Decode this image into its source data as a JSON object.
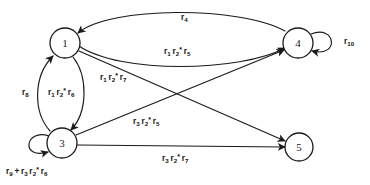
{
  "diagram": {
    "type": "state-transition-diagram",
    "background_color": "#ffffff",
    "stroke_color": "#1a1a1a",
    "nodes": [
      {
        "id": "1",
        "label": "1",
        "cx": 65,
        "cy": 43,
        "r": 15
      },
      {
        "id": "3",
        "label": "3",
        "cx": 62,
        "cy": 143,
        "r": 15
      },
      {
        "id": "4",
        "label": "4",
        "cx": 298,
        "cy": 43,
        "r": 15
      },
      {
        "id": "5",
        "label": "5",
        "cx": 299,
        "cy": 147,
        "r": 14
      }
    ],
    "edges": [
      {
        "id": "e-4-1",
        "from": "4",
        "to": "1",
        "shape": "arc-top",
        "label_plain": "r4",
        "label_parts": [
          {
            "base": "r",
            "sub": "4",
            "star": false
          }
        ],
        "label_x": 181,
        "label_y": 14
      },
      {
        "id": "e-1-4",
        "from": "1",
        "to": "4",
        "shape": "arc-bottom",
        "label_plain": "r1 r2* r5",
        "label_parts": [
          {
            "base": "r",
            "sub": "1",
            "star": false
          },
          {
            "base": "r",
            "sub": "2",
            "star": true
          },
          {
            "base": "r",
            "sub": "5",
            "star": false
          }
        ],
        "label_x": 164,
        "label_y": 48
      },
      {
        "id": "e-1-3",
        "from": "1",
        "to": "3",
        "shape": "lens-right",
        "label_plain": "r1 r2* r6",
        "label_parts": [
          {
            "base": "r",
            "sub": "1",
            "star": false
          },
          {
            "base": "r",
            "sub": "2",
            "star": true
          },
          {
            "base": "r",
            "sub": "6",
            "star": false
          }
        ],
        "label_x": 48,
        "label_y": 89
      },
      {
        "id": "e-3-1",
        "from": "3",
        "to": "1",
        "shape": "lens-left",
        "label_plain": "r8",
        "label_parts": [
          {
            "base": "r",
            "sub": "8",
            "star": false
          }
        ],
        "label_x": 22,
        "label_y": 89
      },
      {
        "id": "e-1-5",
        "from": "1",
        "to": "5",
        "shape": "diagonal",
        "label_plain": "r1 r2* r7",
        "label_parts": [
          {
            "base": "r",
            "sub": "1",
            "star": false
          },
          {
            "base": "r",
            "sub": "2",
            "star": true
          },
          {
            "base": "r",
            "sub": "7",
            "star": false
          }
        ],
        "label_x": 100,
        "label_y": 74
      },
      {
        "id": "e-3-4",
        "from": "3",
        "to": "4",
        "shape": "diagonal",
        "label_plain": "r3 r2* r5",
        "label_parts": [
          {
            "base": "r",
            "sub": "3",
            "star": false
          },
          {
            "base": "r",
            "sub": "2",
            "star": true
          },
          {
            "base": "r",
            "sub": "5",
            "star": false
          }
        ],
        "label_x": 133,
        "label_y": 118
      },
      {
        "id": "e-3-5",
        "from": "3",
        "to": "5",
        "shape": "straight",
        "label_plain": "r3 r2* r7",
        "label_parts": [
          {
            "base": "r",
            "sub": "3",
            "star": false
          },
          {
            "base": "r",
            "sub": "2",
            "star": true
          },
          {
            "base": "r",
            "sub": "7",
            "star": false
          }
        ],
        "label_x": 162,
        "label_y": 155
      },
      {
        "id": "e-4-4",
        "from": "4",
        "to": "4",
        "shape": "self-loop-right",
        "label_plain": "r10",
        "label_parts": [
          {
            "base": "r",
            "sub": "10",
            "star": false
          }
        ],
        "label_x": 344,
        "label_y": 38
      },
      {
        "id": "e-3-3",
        "from": "3",
        "to": "3",
        "shape": "self-loop-left",
        "label_plain": "r9 + r3 r2* r6",
        "label_parts": [
          {
            "base": "r",
            "sub": "9",
            "star": false
          },
          {
            "op": "+"
          },
          {
            "base": "r",
            "sub": "3",
            "star": false
          },
          {
            "base": "r",
            "sub": "2",
            "star": true
          },
          {
            "base": "r",
            "sub": "6",
            "star": false
          }
        ],
        "label_x": 6,
        "label_y": 168
      }
    ]
  }
}
